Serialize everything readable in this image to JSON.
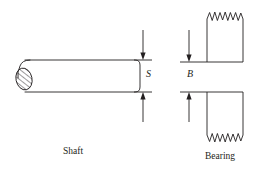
{
  "figure": {
    "kind": "engineering-diagram",
    "background_color": "#ffffff",
    "line_color": "#231f20",
    "line_width": 0.9
  },
  "labels": {
    "shaft": "Shaft",
    "bearing": "Bearing",
    "dimension_s": "S",
    "dimension_b": "B"
  },
  "shaft": {
    "name": "shaft",
    "shape": "rounded-rectangle",
    "x": 18,
    "y": 60,
    "width": 122,
    "height": 32,
    "corner_radius": 5,
    "break_symbol": "hatched-ellipse",
    "break_symbol_x": 24,
    "break_symbol_y": 79,
    "break_symbol_rx": 8,
    "break_symbol_ry": 11,
    "hatch_angle_deg": 45
  },
  "bearings": [
    {
      "name": "bearing-upper",
      "x": 207,
      "y": 12,
      "width": 36,
      "height": 50,
      "break_edge": "top",
      "break_style": "zigzag",
      "zigzag_teeth": 7,
      "zigzag_amplitude": 9
    },
    {
      "name": "bearing-lower",
      "x": 207,
      "y": 92,
      "width": 36,
      "height": 50,
      "break_edge": "bottom",
      "break_style": "zigzag",
      "zigzag_teeth": 7,
      "zigzag_amplitude": 9
    }
  ],
  "dimensions": [
    {
      "name": "dimension-s",
      "label": "S",
      "axis": "vertical",
      "line_x": 143,
      "top_from": 30,
      "top_to": 60,
      "bottom_from": 122,
      "bottom_to": 92,
      "extension_line_x1": 134,
      "extension_line_x2": 152,
      "extension_top_y": 60,
      "extension_bottom_y": 92,
      "arrow_style": "solid-filled"
    },
    {
      "name": "dimension-b",
      "label": "B",
      "axis": "vertical",
      "line_x": 189,
      "top_from": 30,
      "top_to": 62,
      "bottom_from": 122,
      "bottom_to": 92,
      "extension_line_x1": 180,
      "extension_line_x2": 207,
      "extension_top_y": 62,
      "extension_bottom_y": 92,
      "arrow_style": "solid-filled"
    }
  ]
}
